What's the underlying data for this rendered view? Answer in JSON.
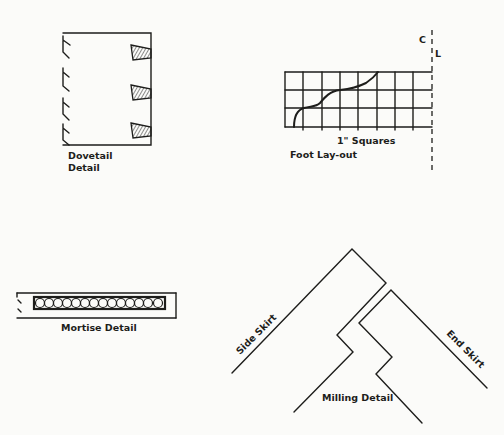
{
  "figure": {
    "background": "#fbfbf9",
    "ink": "#1d1d1b",
    "panels": {
      "dovetail": {
        "label_line1": "Dovetail",
        "label_line2": "Detail",
        "dovetail_count": 3
      },
      "foot_layout": {
        "grid_label": "1\" Squares",
        "label": "Foot Lay-out",
        "centerline_label_c": "C",
        "centerline_label_l": "L",
        "grid_columns": 8,
        "grid_rows": 3
      },
      "mortise": {
        "label": "Mortise Detail",
        "hole_count": 14
      },
      "milling": {
        "label": "Milling Detail",
        "side_label": "Side Skirt",
        "end_label": "End Skirt"
      }
    }
  }
}
